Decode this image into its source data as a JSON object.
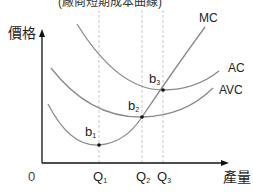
{
  "title_partial": "(廠商短期成本曲線)",
  "axes": {
    "y_label": "價格",
    "x_label": "產量",
    "origin": "0"
  },
  "curves": [
    {
      "name": "MC",
      "label": "MC"
    },
    {
      "name": "AC",
      "label": "AC"
    },
    {
      "name": "AVC",
      "label": "AVC"
    }
  ],
  "points": [
    {
      "name": "b1",
      "base": "b",
      "sub": "1"
    },
    {
      "name": "b2",
      "base": "b",
      "sub": "2"
    },
    {
      "name": "b3",
      "base": "b",
      "sub": "3"
    }
  ],
  "quantities": [
    {
      "name": "Q1",
      "base": "Q",
      "sub": "1"
    },
    {
      "name": "Q2",
      "base": "Q",
      "sub": "2"
    },
    {
      "name": "Q3",
      "base": "Q",
      "sub": "3"
    }
  ],
  "colors": {
    "curve": "#8a8a8a",
    "axis": "#111111",
    "guide": "#b5b5b5",
    "point": "#111111"
  }
}
